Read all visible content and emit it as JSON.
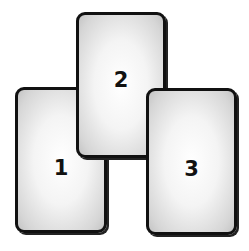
{
  "spread": {
    "cards": [
      {
        "label": "1"
      },
      {
        "label": "2"
      },
      {
        "label": "3"
      }
    ]
  }
}
